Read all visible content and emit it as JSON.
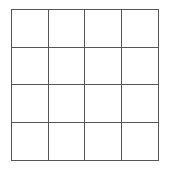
{
  "grid": {
    "rows": 4,
    "cols": 4,
    "line_color": "#555555",
    "cells": [
      [
        "",
        "",
        "",
        ""
      ],
      [
        "",
        "",
        "",
        ""
      ],
      [
        "",
        "",
        "",
        ""
      ],
      [
        "",
        "",
        "",
        ""
      ]
    ]
  }
}
